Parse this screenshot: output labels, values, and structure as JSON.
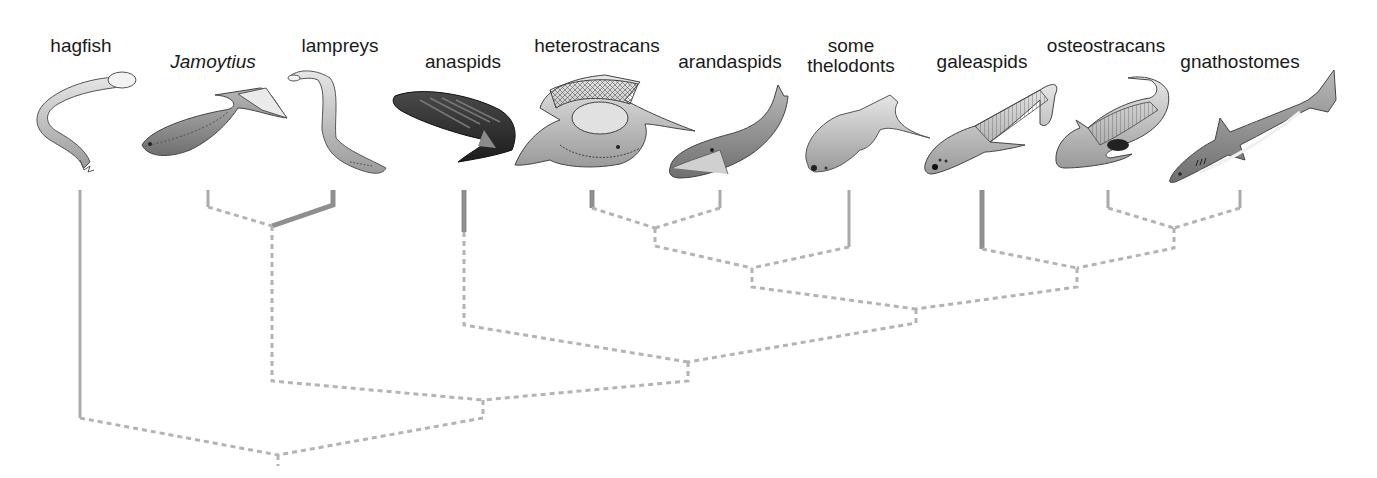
{
  "figure": {
    "type": "cladogram",
    "colors": {
      "solid_branch": "#a9a9a9",
      "thick_branch": "#8f8f8f",
      "dashed_branch": "#b4b4b4",
      "label_text": "#1a1a1a"
    }
  },
  "taxa": [
    {
      "id": "hagfish",
      "label": "hagfish",
      "italic": false,
      "label_x": 81,
      "label_y": 36,
      "tip_x": 80
    },
    {
      "id": "jamoytius",
      "label": "Jamoytius",
      "italic": true,
      "label_x": 213,
      "label_y": 52,
      "tip_x": 208
    },
    {
      "id": "lampreys",
      "label": "lampreys",
      "italic": false,
      "label_x": 340,
      "label_y": 36,
      "tip_x": 333
    },
    {
      "id": "anaspids",
      "label": "anaspids",
      "italic": false,
      "label_x": 463,
      "label_y": 52,
      "tip_x": 464
    },
    {
      "id": "heterostracans",
      "label": "heterostracans",
      "italic": false,
      "label_x": 597,
      "label_y": 36,
      "tip_x": 592
    },
    {
      "id": "arandaspids",
      "label": "arandaspids",
      "italic": false,
      "label_x": 730,
      "label_y": 52,
      "tip_x": 720
    },
    {
      "id": "some-thelodonts",
      "label_lines": [
        "some",
        "thelodonts"
      ],
      "italic": false,
      "label_x": 851,
      "label_y": 36,
      "tip_x": 849
    },
    {
      "id": "galeaspids",
      "label": "galeaspids",
      "italic": false,
      "label_x": 982,
      "label_y": 52,
      "tip_x": 982
    },
    {
      "id": "osteostracans",
      "label": "osteostracans",
      "italic": false,
      "label_x": 1106,
      "label_y": 36,
      "tip_x": 1108
    },
    {
      "id": "gnathostomes",
      "label": "gnathostomes",
      "italic": false,
      "label_x": 1240,
      "label_y": 52,
      "tip_x": 1240
    }
  ],
  "tree": {
    "topology": "(hagfish,((Jamoytius,lampreys),(anaspids,(((heterostracans,arandaspids),some thelodonts),(galeaspids,(osteostracans,gnathostomes))))))",
    "solid_segments": [
      {
        "taxon": "hagfish",
        "points": [
          [
            80,
            190
          ],
          [
            80,
            418
          ]
        ],
        "width": 3
      },
      {
        "taxon": "jamoytius",
        "points": [
          [
            208,
            190
          ],
          [
            208,
            207
          ]
        ],
        "width": 3
      },
      {
        "taxon": "lampreys",
        "points": [
          [
            333,
            190
          ],
          [
            333,
            205
          ],
          [
            272,
            226
          ]
        ],
        "width": 5
      },
      {
        "taxon": "anaspids",
        "points": [
          [
            464,
            190
          ],
          [
            464,
            232
          ]
        ],
        "width": 5
      },
      {
        "taxon": "heterostracans",
        "points": [
          [
            592,
            190
          ],
          [
            592,
            208
          ]
        ],
        "width": 5
      },
      {
        "taxon": "arandaspids",
        "points": [
          [
            720,
            190
          ],
          [
            720,
            208
          ]
        ],
        "width": 3
      },
      {
        "taxon": "some-thelodonts",
        "points": [
          [
            849,
            190
          ],
          [
            849,
            247
          ]
        ],
        "width": 3
      },
      {
        "taxon": "galeaspids",
        "points": [
          [
            982,
            190
          ],
          [
            982,
            249
          ]
        ],
        "width": 5
      },
      {
        "taxon": "osteostracans",
        "points": [
          [
            1108,
            190
          ],
          [
            1108,
            208
          ]
        ],
        "width": 3
      },
      {
        "taxon": "gnathostomes",
        "points": [
          [
            1240,
            190
          ],
          [
            1240,
            208
          ]
        ],
        "width": 3
      }
    ],
    "dashed_segments": [
      {
        "name": "jamoytius-to-node",
        "points": [
          [
            208,
            207
          ],
          [
            272,
            226
          ]
        ]
      },
      {
        "name": "jamoytius-lamprey-stem",
        "points": [
          [
            272,
            226
          ],
          [
            272,
            381
          ],
          [
            483,
            400
          ]
        ]
      },
      {
        "name": "anaspids-stem",
        "points": [
          [
            464,
            232
          ],
          [
            464,
            325
          ],
          [
            688,
            362
          ]
        ]
      },
      {
        "name": "heterostracans-to-node",
        "points": [
          [
            592,
            208
          ],
          [
            655,
            228
          ]
        ]
      },
      {
        "name": "arandaspids-to-node",
        "points": [
          [
            720,
            208
          ],
          [
            655,
            228
          ]
        ]
      },
      {
        "name": "pteraspidomorph-stem",
        "points": [
          [
            655,
            228
          ],
          [
            655,
            246
          ],
          [
            752,
            268
          ]
        ]
      },
      {
        "name": "thelodonts-to-node",
        "points": [
          [
            849,
            247
          ],
          [
            752,
            268
          ]
        ]
      },
      {
        "name": "thelodont-clade-stem",
        "points": [
          [
            752,
            268
          ],
          [
            752,
            287
          ],
          [
            916,
            309
          ]
        ]
      },
      {
        "name": "osteostracans-to-node",
        "points": [
          [
            1108,
            208
          ],
          [
            1174,
            228
          ]
        ]
      },
      {
        "name": "gnathostomes-to-node",
        "points": [
          [
            1240,
            208
          ],
          [
            1174,
            228
          ]
        ]
      },
      {
        "name": "osteo-gnatho-stem",
        "points": [
          [
            1174,
            228
          ],
          [
            1174,
            248
          ],
          [
            1077,
            268
          ]
        ]
      },
      {
        "name": "galeaspids-to-node",
        "points": [
          [
            982,
            249
          ],
          [
            1077,
            268
          ]
        ]
      },
      {
        "name": "galeaspid-clade-stem",
        "points": [
          [
            1077,
            268
          ],
          [
            1077,
            287
          ],
          [
            916,
            309
          ]
        ]
      },
      {
        "name": "crown-stem",
        "points": [
          [
            916,
            309
          ],
          [
            916,
            323
          ],
          [
            688,
            362
          ]
        ]
      },
      {
        "name": "anaspid-crown-stem",
        "points": [
          [
            688,
            362
          ],
          [
            688,
            381
          ],
          [
            483,
            400
          ]
        ]
      },
      {
        "name": "vertebrate-stem",
        "points": [
          [
            483,
            400
          ],
          [
            483,
            418
          ],
          [
            278,
            455
          ]
        ]
      },
      {
        "name": "hagfish-to-root",
        "points": [
          [
            80,
            418
          ],
          [
            278,
            455
          ]
        ]
      },
      {
        "name": "root",
        "points": [
          [
            278,
            455
          ],
          [
            278,
            466
          ]
        ]
      }
    ]
  }
}
